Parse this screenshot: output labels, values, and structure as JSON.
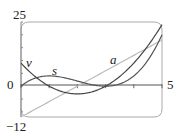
{
  "chart_data": {
    "type": "line",
    "title": "",
    "xlabel": "",
    "ylabel": "",
    "xlim": [
      0,
      5
    ],
    "ylim": [
      -12,
      25
    ],
    "x_tick_labels": [
      "0",
      "5"
    ],
    "y_tick_labels": [
      "25",
      "-12"
    ],
    "x_ticks": [
      0,
      1,
      2,
      3,
      4,
      5
    ],
    "grid": false,
    "series": [
      {
        "name": "s",
        "formula": "t^3 - 6t^2 + 9t",
        "x": [
          0,
          0.5,
          1,
          1.5,
          2,
          2.5,
          3,
          3.5,
          4,
          4.5,
          5
        ],
        "values": [
          0,
          3.125,
          4,
          3.375,
          2,
          0.625,
          0,
          0.875,
          4,
          10.125,
          20
        ],
        "color": "#555555"
      },
      {
        "name": "v",
        "formula": "3t^2 - 12t + 9",
        "x": [
          0,
          0.5,
          1,
          1.5,
          2,
          2.5,
          3,
          3.5,
          4,
          4.5,
          5
        ],
        "values": [
          9,
          3.75,
          0,
          -2.25,
          -3,
          -2.25,
          0,
          3.75,
          9,
          15.75,
          24
        ],
        "color": "#444444"
      },
      {
        "name": "a",
        "formula": "6t - 12",
        "x": [
          0,
          5
        ],
        "values": [
          -12,
          18
        ],
        "color": "#bbbbbb"
      }
    ],
    "annotations": [
      {
        "text": "v",
        "near": "left, upper"
      },
      {
        "text": "s",
        "near": "t≈1.3 above hump"
      },
      {
        "text": "a",
        "near": "t≈3.5 above line"
      }
    ]
  },
  "labels": {
    "y_top": "25",
    "y_bottom": "−12",
    "x_left": "0",
    "x_right": "5",
    "curve_v": "v",
    "curve_s": "s",
    "curve_a": "a"
  }
}
